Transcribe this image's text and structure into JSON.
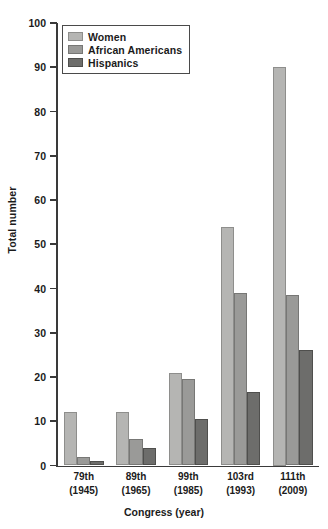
{
  "chart_data": {
    "type": "bar",
    "title": "",
    "xlabel": "Congress (year)",
    "ylabel": "Total number",
    "categories": [
      "79th\n(1945)",
      "89th\n(1965)",
      "99th\n(1985)",
      "103rd\n(1993)",
      "111th\n(2009)"
    ],
    "category_labels": [
      {
        "congress": "79th",
        "year": "(1945)"
      },
      {
        "congress": "89th",
        "year": "(1965)"
      },
      {
        "congress": "99th",
        "year": "(1985)"
      },
      {
        "congress": "103rd",
        "year": "(1993)"
      },
      {
        "congress": "111th",
        "year": "(2009)"
      }
    ],
    "series": [
      {
        "name": "Women",
        "color": "#b5b5b3",
        "values": [
          12,
          12,
          21,
          54,
          90
        ]
      },
      {
        "name": "African Americans",
        "color": "#9a9a98",
        "values": [
          2,
          6,
          19.5,
          39,
          38.5
        ]
      },
      {
        "name": "Hispanics",
        "color": "#6d6d6b",
        "values": [
          1,
          4,
          10.5,
          16.5,
          26
        ]
      }
    ],
    "ylim": [
      0,
      100
    ],
    "yticks": [
      0,
      10,
      20,
      30,
      40,
      50,
      60,
      70,
      80,
      90,
      100
    ],
    "ytick_labels": [
      "0",
      "10",
      "20",
      "30",
      "40",
      "50",
      "60",
      "70",
      "80",
      "90",
      "100"
    ],
    "grid": false,
    "legend_position": "top-left"
  }
}
